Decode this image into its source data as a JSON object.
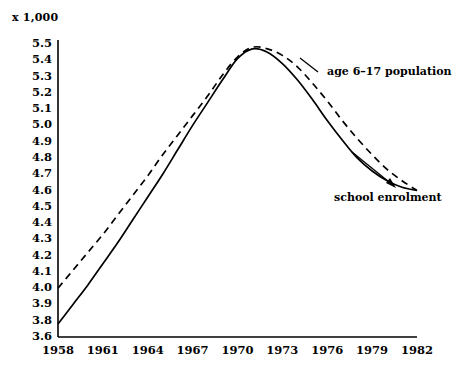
{
  "chart_data": {
    "type": "line",
    "title": "",
    "subtitle": "",
    "unit_note": "x 1,000",
    "xlabel": "",
    "ylabel": "",
    "xlim": [
      1958,
      1982
    ],
    "ylim": [
      3.6,
      5.5
    ],
    "grid": false,
    "legend_position": "inline-annotations",
    "x_tick_labels": [
      "1958",
      "1961",
      "1964",
      "1967",
      "1970",
      "1973",
      "1976",
      "1979",
      "1982"
    ],
    "x_ticks": [
      1958,
      1961,
      1964,
      1967,
      1970,
      1973,
      1976,
      1979,
      1982
    ],
    "y_tick_labels": [
      "5.5",
      "5.4",
      "5.3",
      "5.2",
      "5.1",
      "5.0",
      "4.9",
      "4.8",
      "4.7",
      "4.6",
      "4.5",
      "4.4",
      "4.3",
      "4.2",
      "4.1",
      "4.0",
      "3.9",
      "3.8",
      "3.6"
    ],
    "y_ticks": [
      5.5,
      5.4,
      5.3,
      5.2,
      5.1,
      5.0,
      4.9,
      4.8,
      4.7,
      4.6,
      4.5,
      4.4,
      4.3,
      4.2,
      4.1,
      4.0,
      3.9,
      3.8,
      3.6
    ],
    "series": [
      {
        "name": "age 6–17 population",
        "style": "dashed",
        "color": "#000000",
        "annotation": "age 6–17 population",
        "x": [
          1958,
          1959,
          1960,
          1961,
          1962,
          1963,
          1964,
          1965,
          1966,
          1967,
          1968,
          1969,
          1970,
          1971,
          1972,
          1973,
          1974,
          1975,
          1976,
          1977,
          1978,
          1979,
          1980,
          1981,
          1982
        ],
        "values": [
          4.0,
          4.11,
          4.22,
          4.33,
          4.45,
          4.57,
          4.69,
          4.82,
          4.94,
          5.06,
          5.18,
          5.31,
          5.42,
          5.48,
          5.47,
          5.43,
          5.36,
          5.26,
          5.15,
          5.03,
          4.92,
          4.82,
          4.73,
          4.66,
          4.6
        ]
      },
      {
        "name": "school enrolment",
        "style": "solid",
        "color": "#000000",
        "annotation": "school enrolment",
        "x": [
          1958,
          1959,
          1960,
          1961,
          1962,
          1963,
          1964,
          1965,
          1966,
          1967,
          1968,
          1969,
          1970,
          1971,
          1972,
          1973,
          1974,
          1975,
          1976,
          1977,
          1978,
          1979,
          1980,
          1981,
          1982
        ],
        "values": [
          3.78,
          3.9,
          4.02,
          4.15,
          4.28,
          4.42,
          4.56,
          4.7,
          4.85,
          5.0,
          5.14,
          5.28,
          5.41,
          5.47,
          5.45,
          5.38,
          5.28,
          5.16,
          5.03,
          4.91,
          4.8,
          4.72,
          4.66,
          4.62,
          4.6
        ]
      }
    ]
  },
  "axes": {
    "y_axis_name": "value-axis",
    "x_axis_name": "year-axis"
  }
}
